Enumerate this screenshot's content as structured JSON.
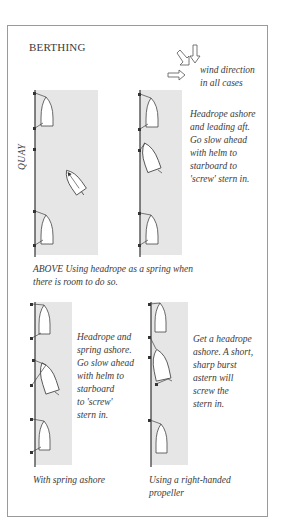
{
  "title": "BERTHING",
  "wind": {
    "label_line1": "wind direction",
    "label_line2": "in all cases",
    "icon": "wind-arrows-icon"
  },
  "quay_label": "QUAY",
  "panels": [
    {
      "id": "top-left",
      "description": ""
    },
    {
      "id": "top-right",
      "description_lines": [
        "Headrope ashore",
        "and leading aft.",
        "Go slow ahead",
        "with helm to",
        "starboard to",
        "'screw' stern in."
      ]
    },
    {
      "id": "bottom-left",
      "description_lines": [
        "Headrope and",
        "spring ashore.",
        "Go slow ahead",
        "with helm to",
        "starboard",
        "to 'screw'",
        "stern in."
      ],
      "caption": "With spring ashore"
    },
    {
      "id": "bottom-right",
      "description_lines": [
        "Get a headrope",
        "ashore. A short,",
        "sharp burst",
        "astern will",
        "screw the",
        "stern in."
      ],
      "caption_lines": [
        "Using a right-handed",
        "propeller"
      ]
    }
  ],
  "above_caption": {
    "line1": "ABOVE  Using headrope as a spring when",
    "line2": "there is room to do so."
  },
  "colors": {
    "water": "#e6e6e6",
    "frame": "#9a9a9a",
    "line": "#333333",
    "text": "#3a3a3a"
  }
}
